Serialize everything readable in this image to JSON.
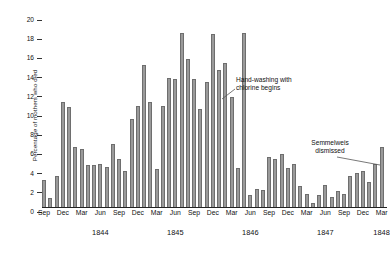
{
  "chart_data": {
    "type": "bar",
    "title": "",
    "xlabel": "",
    "ylabel": "Percentage of mothers who died",
    "ylim": [
      0,
      20
    ],
    "ytick_values": [
      0,
      2,
      4,
      6,
      8,
      10,
      12,
      14,
      16,
      18,
      20
    ],
    "ytick_labels": [
      "0",
      "2",
      "4",
      "6",
      "8",
      "10",
      "12",
      "14",
      "16",
      "18",
      "20"
    ],
    "grid": false,
    "legend": null,
    "bar_color": "#9a9a9a",
    "bar_edge_color": "#6e6e6e",
    "axis_color": "#222222",
    "x_tick_labels": [
      "Sep",
      "Dec",
      "Mar",
      "Jun",
      "Sep",
      "Dec",
      "Mar",
      "Jun",
      "Sep",
      "Dec",
      "Mar",
      "Jun",
      "Sep",
      "Dec",
      "Mar",
      "Jun",
      "Sep",
      "Dec",
      "Mar"
    ],
    "x_tick_indices": [
      0,
      3,
      6,
      9,
      12,
      15,
      18,
      21,
      24,
      27,
      30,
      33,
      36,
      39,
      42,
      45,
      48,
      51,
      54
    ],
    "x_year_labels": [
      "1844",
      "1845",
      "1846",
      "1847",
      "1848"
    ],
    "x_year_indices": [
      9,
      21,
      33,
      45,
      54
    ],
    "categories": [
      "Sep 1843",
      "Oct 1843",
      "Nov 1843",
      "Dec 1843",
      "Jan 1844",
      "Feb 1844",
      "Mar 1844",
      "Apr 1844",
      "May 1844",
      "Jun 1844",
      "Jul 1844",
      "Aug 1844",
      "Sep 1844",
      "Oct 1844",
      "Nov 1844",
      "Dec 1844",
      "Jan 1845",
      "Feb 1845",
      "Mar 1845",
      "Apr 1845",
      "May 1845",
      "Jun 1845",
      "Jul 1845",
      "Aug 1845",
      "Sep 1845",
      "Oct 1845",
      "Nov 1845",
      "Dec 1845",
      "Jan 1846",
      "Feb 1846",
      "Mar 1846",
      "Apr 1846",
      "May 1846",
      "Jun 1846",
      "Jul 1846",
      "Aug 1846",
      "Sep 1846",
      "Oct 1846",
      "Nov 1846",
      "Dec 1846",
      "Jan 1847",
      "Feb 1847",
      "Mar 1847",
      "Apr 1847",
      "May 1847",
      "Jun 1847",
      "Jul 1847",
      "Aug 1847",
      "Sep 1847",
      "Oct 1847",
      "Nov 1847",
      "Dec 1847",
      "Jan 1848",
      "Feb 1848",
      "Mar 1848"
    ],
    "values": [
      2.8,
      0.9,
      3.2,
      10.9,
      10.4,
      6.2,
      6.0,
      4.4,
      4.4,
      4.5,
      4.2,
      6.6,
      5.0,
      3.8,
      9.2,
      10.5,
      14.8,
      10.9,
      4.0,
      10.5,
      13.4,
      13.3,
      18.1,
      15.4,
      13.3,
      10.2,
      13.0,
      18.0,
      14.3,
      15.0,
      11.5,
      4.1,
      18.1,
      1.2,
      1.9,
      1.8,
      5.2,
      5.0,
      5.5,
      4.1,
      4.5,
      2.2,
      1.4,
      0.4,
      1.2,
      2.3,
      1.0,
      1.7,
      1.4,
      3.2,
      3.5,
      3.7,
      2.6,
      4.5,
      6.3
    ],
    "annotations": [
      {
        "id": "handwashing",
        "text_lines": [
          "Hand-washing with",
          "chlorine begins"
        ],
        "points_to_category": "May 1847",
        "points_to_index": 44
      },
      {
        "id": "dismissed",
        "text_lines": [
          "Semmelweis",
          "dismissed"
        ],
        "points_to_category": "Mar 1848",
        "points_to_index": 54
      }
    ]
  },
  "layout": {
    "plot_left": 42,
    "plot_top": 15,
    "plot_width": 344,
    "plot_height": 192,
    "bar_pitch": 6.25,
    "bar_width": 4.2
  }
}
